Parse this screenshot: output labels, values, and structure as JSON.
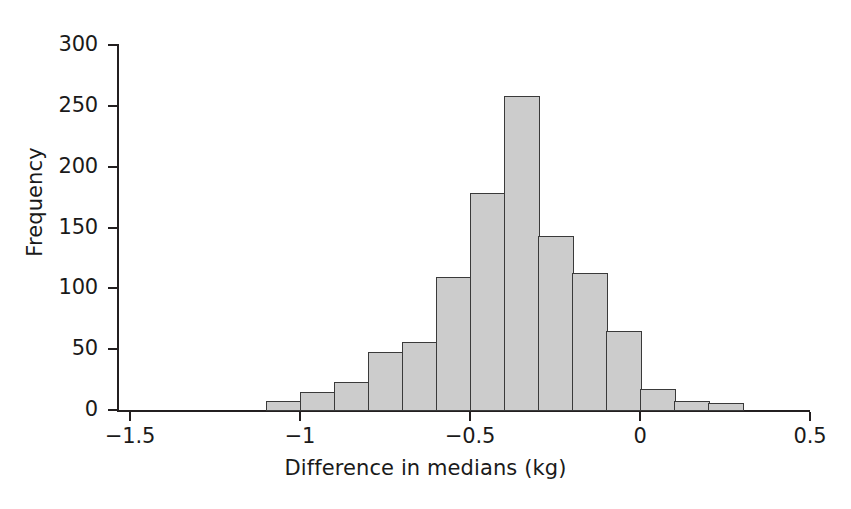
{
  "chart_data": {
    "type": "bar",
    "chart_subtype": "histogram",
    "title": "",
    "xlabel": "Difference in medians (kg)",
    "ylabel": "Frequency",
    "xlim": [
      -1.5,
      0.5
    ],
    "ylim": [
      0,
      300
    ],
    "grid": false,
    "legend": null,
    "bin_width": 0.1,
    "x_ticks": [
      "−1.5",
      "−1",
      "−0.5",
      "0",
      "0.5"
    ],
    "x_tick_values": [
      -1.5,
      -1,
      -0.5,
      0,
      0.5
    ],
    "y_ticks": [
      "0",
      "50",
      "100",
      "150",
      "200",
      "250",
      "300"
    ],
    "y_tick_values": [
      0,
      50,
      100,
      150,
      200,
      250,
      300
    ],
    "bin_starts": [
      -1.1,
      -1.0,
      -0.9,
      -0.8,
      -0.7,
      -0.6,
      -0.5,
      -0.4,
      -0.3,
      -0.2,
      -0.1,
      0.0,
      0.1,
      0.2
    ],
    "bin_ends": [
      -1.0,
      -0.9,
      -0.8,
      -0.7,
      -0.6,
      -0.5,
      -0.4,
      -0.3,
      -0.2,
      -0.1,
      0.0,
      0.1,
      0.2,
      0.3
    ],
    "bin_labels": [
      "-1.1 to -1.0",
      "-1.0 to -0.9",
      "-0.9 to -0.8",
      "-0.8 to -0.7",
      "-0.7 to -0.6",
      "-0.6 to -0.5",
      "-0.5 to -0.4",
      "-0.4 to -0.3",
      "-0.3 to -0.2",
      "-0.2 to -0.1",
      "-0.1 to 0.0",
      "0.0 to 0.1",
      "0.1 to 0.2",
      "0.2 to 0.3"
    ],
    "values": [
      7,
      15,
      23,
      48,
      56,
      109,
      178,
      258,
      143,
      113,
      65,
      17,
      7,
      6
    ],
    "colors": {
      "bar_fill": "#cccccc",
      "bar_edge": "#3a3a3a",
      "axis": "#231f20",
      "text": "#1a1a1a",
      "background": "#ffffff"
    }
  }
}
